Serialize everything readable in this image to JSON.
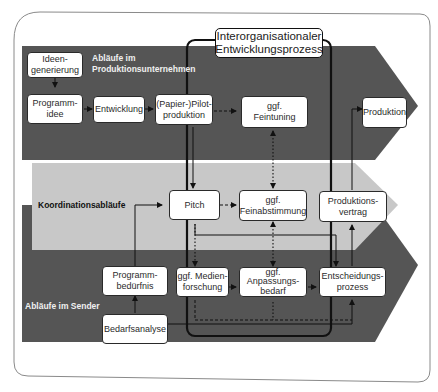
{
  "title": "Interorganisationaler\nEntwicklungsprozess",
  "colors": {
    "lane_dark": "#555555",
    "lane_light": "#c8c8c8",
    "box_fill": "#ffffff",
    "line": "#111111"
  },
  "lanes": [
    {
      "id": "produktion",
      "label": "Abläufe im\nProduktionsunternehmen"
    },
    {
      "id": "koordination",
      "label": "Koordinationsabläufe"
    },
    {
      "id": "sender",
      "label": "Abläufe im Sender"
    }
  ],
  "nodes": {
    "ideengenerierung": "Ideen-\ngenerierung",
    "programmidee": "Programm-\nidee",
    "entwicklung": "Entwicklung",
    "pilotproduktion": "(Papier-)Pilot-\nproduktion",
    "feintuning": "ggf.\nFeintuning",
    "produktion": "Produktion",
    "pitch": "Pitch",
    "feinabstimmung": "ggf.\nFeinabstimmung",
    "produktionsvertrag": "Produktions-\nvertrag",
    "programmbeduerfnis": "Programm-\nbedürfnis",
    "medienforschung": "ggf. Medien-\nforschung",
    "anpassungsbedarf": "ggf.\nAnpassungs-\nbedarf",
    "entscheidungsprozess": "Entscheidungs-\nprozess",
    "bedarfsanalyse": "Bedarfsanalyse"
  },
  "edges": [
    {
      "from": "Ideengenerierung",
      "to": "Programmidee",
      "style": "solid"
    },
    {
      "from": "Programmidee",
      "to": "Entwicklung",
      "style": "solid"
    },
    {
      "from": "Entwicklung",
      "to": "(Papier-)Pilotproduktion",
      "style": "solid"
    },
    {
      "from": "(Papier-)Pilotproduktion",
      "to": "ggf. Feintuning",
      "style": "dashed"
    },
    {
      "from": "(Papier-)Pilotproduktion",
      "to": "Pitch",
      "style": "solid"
    },
    {
      "from": "ggf. Feintuning",
      "to": "ggf. Feinabstimmung",
      "style": "dotted-bidirectional"
    },
    {
      "from": "Pitch",
      "to": "ggf. Feinabstimmung",
      "style": "dashed"
    },
    {
      "from": "Pitch",
      "to": "ggf. Medienforschung",
      "style": "dotted"
    },
    {
      "from": "Pitch",
      "to": "Entscheidungsprozess",
      "style": "solid"
    },
    {
      "from": "ggf. Feinabstimmung",
      "to": "ggf. Anpassungsbedarf",
      "style": "dotted-bidirectional"
    },
    {
      "from": "ggf. Medienforschung",
      "to": "ggf. Anpassungsbedarf",
      "style": "dashed"
    },
    {
      "from": "ggf. Anpassungsbedarf",
      "to": "Entscheidungsprozess",
      "style": "dashed"
    },
    {
      "from": "ggf. Medienforschung",
      "to": "Entscheidungsprozess",
      "style": "dashed"
    },
    {
      "from": "Entscheidungsprozess",
      "to": "Produktionsvertrag",
      "style": "solid"
    },
    {
      "from": "Produktionsvertrag",
      "to": "Produktion",
      "style": "solid"
    },
    {
      "from": "Bedarfsanalyse",
      "to": "Programmbedürfnis",
      "style": "solid"
    },
    {
      "from": "Bedarfsanalyse",
      "to": "Entscheidungsprozess",
      "style": "solid"
    },
    {
      "from": "Programmbedürfnis",
      "to": "Pitch",
      "style": "solid"
    }
  ]
}
